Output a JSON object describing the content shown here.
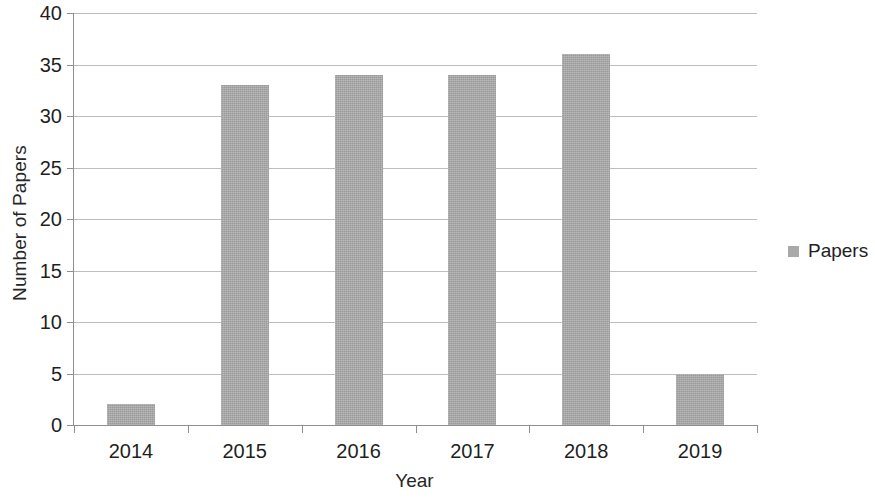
{
  "chart_data": {
    "type": "bar",
    "title": "",
    "xlabel": "Year",
    "ylabel": "Number of Papers",
    "categories": [
      "2014",
      "2015",
      "2016",
      "2017",
      "2018",
      "2019"
    ],
    "values": [
      2,
      33,
      34,
      34,
      36,
      5
    ],
    "series": [
      {
        "name": "Papers",
        "values": [
          2,
          33,
          34,
          34,
          36,
          5
        ]
      }
    ],
    "ylim": [
      0,
      40
    ],
    "ytick_step": 5,
    "yticks": [
      0,
      5,
      10,
      15,
      20,
      25,
      30,
      35,
      40
    ],
    "ytick_labels": [
      "0",
      "5",
      "10",
      "15",
      "20",
      "25",
      "30",
      "35",
      "40"
    ],
    "grid": true,
    "grid_axis": "y",
    "legend": {
      "position": "right",
      "entries": [
        {
          "label": "Papers",
          "color": "#a9a9a9",
          "marker": "square"
        }
      ]
    },
    "bar_color": "#a9a9a9",
    "gridline_color": "#bdbdbd",
    "axis_color": "#8f8f8f",
    "background_color": "#ffffff"
  }
}
